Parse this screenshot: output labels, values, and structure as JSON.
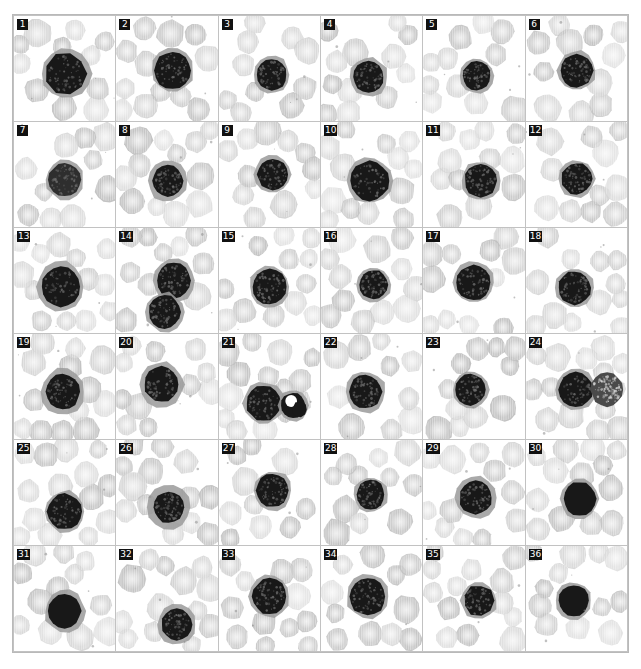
{
  "figure": {
    "name": "blood-cell-montage",
    "grid": {
      "columns": 6,
      "rows": 36
    },
    "colors": {
      "page_background": "#ffffff",
      "panel_background": "#ffffff",
      "grid_line": "#c2c2c2",
      "outer_border": "#b9b9b9",
      "badge_background": "#111111",
      "badge_text": "#ffffff",
      "rbc_fill": "#bdbdbd",
      "rbc_fill_light": "#d4d4d4",
      "nucleus_dark": "#181818",
      "nucleus_mid": "#2e2e2e",
      "cytoplasm": "#9a9a9a"
    }
  },
  "panels": [
    {
      "label": "1",
      "seed": 11,
      "rbc": 11,
      "nucleus": {
        "cx": 52,
        "cy": 55,
        "r": 20,
        "tone": "dark",
        "texture": "speckle",
        "cytoplasm": 4,
        "angular": true
      }
    },
    {
      "label": "2",
      "seed": 23,
      "rbc": 12,
      "nucleus": {
        "cx": 56,
        "cy": 52,
        "r": 18,
        "tone": "dark",
        "texture": "speckle",
        "cytoplasm": 3
      }
    },
    {
      "label": "3",
      "seed": 37,
      "rbc": 10,
      "nucleus": {
        "cx": 52,
        "cy": 56,
        "r": 15,
        "tone": "dark",
        "texture": "speckle",
        "cytoplasm": 3
      }
    },
    {
      "label": "4",
      "seed": 41,
      "rbc": 12,
      "nucleus": {
        "cx": 47,
        "cy": 58,
        "r": 15,
        "tone": "dark",
        "texture": "speckle",
        "cytoplasm": 4
      }
    },
    {
      "label": "5",
      "seed": 53,
      "rbc": 11,
      "nucleus": {
        "cx": 53,
        "cy": 57,
        "r": 14,
        "tone": "dark",
        "texture": "speckle",
        "cytoplasm": 3
      }
    },
    {
      "label": "6",
      "seed": 67,
      "rbc": 11,
      "nucleus": {
        "cx": 50,
        "cy": 52,
        "r": 16,
        "tone": "dark",
        "texture": "speckle",
        "cytoplasm": 3
      }
    },
    {
      "label": "7",
      "seed": 71,
      "rbc": 10,
      "nucleus": {
        "cx": 50,
        "cy": 55,
        "r": 16,
        "tone": "mid",
        "texture": "speckle",
        "cytoplasm": 3
      }
    },
    {
      "label": "8",
      "seed": 83,
      "rbc": 12,
      "nucleus": {
        "cx": 51,
        "cy": 56,
        "r": 15,
        "tone": "dark",
        "texture": "speckle",
        "cytoplasm": 5
      }
    },
    {
      "label": "9",
      "seed": 97,
      "rbc": 11,
      "nucleus": {
        "cx": 53,
        "cy": 50,
        "r": 15,
        "tone": "dark",
        "texture": "speckle",
        "cytoplasm": 3
      }
    },
    {
      "label": "10",
      "seed": 103,
      "rbc": 13,
      "nucleus": {
        "cx": 48,
        "cy": 56,
        "r": 19,
        "tone": "dark",
        "texture": "speckle",
        "cytoplasm": 3
      }
    },
    {
      "label": "11",
      "seed": 109,
      "rbc": 12,
      "nucleus": {
        "cx": 57,
        "cy": 56,
        "r": 16,
        "tone": "dark",
        "texture": "speckle",
        "cytoplasm": 3
      }
    },
    {
      "label": "12",
      "seed": 113,
      "rbc": 11,
      "nucleus": {
        "cx": 50,
        "cy": 54,
        "r": 15,
        "tone": "dark",
        "texture": "speckle",
        "cytoplasm": 3
      }
    },
    {
      "label": "13",
      "seed": 127,
      "rbc": 13,
      "nucleus": {
        "cx": 46,
        "cy": 56,
        "r": 19,
        "tone": "dark",
        "texture": "speckle",
        "cytoplasm": 5
      }
    },
    {
      "label": "14",
      "seed": 131,
      "rbc": 11,
      "nucleus": {
        "cx": 57,
        "cy": 50,
        "r": 17,
        "tone": "dark",
        "texture": "speckle",
        "cytoplasm": 4
      },
      "nucleus2": {
        "cx": 48,
        "cy": 80,
        "r": 16,
        "tone": "dark",
        "texture": "speckle",
        "cytoplasm": 3
      }
    },
    {
      "label": "15",
      "seed": 139,
      "rbc": 12,
      "nucleus": {
        "cx": 50,
        "cy": 56,
        "r": 17,
        "tone": "dark",
        "texture": "speckle",
        "cytoplasm": 3
      }
    },
    {
      "label": "16",
      "seed": 149,
      "rbc": 12,
      "nucleus": {
        "cx": 52,
        "cy": 54,
        "r": 14,
        "tone": "dark",
        "texture": "speckle",
        "cytoplasm": 3
      }
    },
    {
      "label": "17",
      "seed": 151,
      "rbc": 11,
      "nucleus": {
        "cx": 50,
        "cy": 52,
        "r": 17,
        "tone": "dark",
        "texture": "speckle",
        "cytoplasm": 3
      }
    },
    {
      "label": "18",
      "seed": 157,
      "rbc": 12,
      "nucleus": {
        "cx": 48,
        "cy": 57,
        "r": 16,
        "tone": "dark",
        "texture": "speckle",
        "cytoplasm": 3
      }
    },
    {
      "label": "19",
      "seed": 163,
      "rbc": 13,
      "nucleus": {
        "cx": 48,
        "cy": 55,
        "r": 17,
        "tone": "dark",
        "texture": "speckle",
        "cytoplasm": 5
      }
    },
    {
      "label": "20",
      "seed": 173,
      "rbc": 11,
      "nucleus": {
        "cx": 45,
        "cy": 48,
        "r": 17,
        "tone": "dark",
        "texture": "speckle",
        "cytoplasm": 5
      }
    },
    {
      "label": "21",
      "seed": 179,
      "rbc": 14,
      "nucleus": {
        "cx": 44,
        "cy": 66,
        "r": 17,
        "tone": "dark",
        "texture": "speckle",
        "cytoplasm": 3
      },
      "nucleus2": {
        "cx": 73,
        "cy": 68,
        "r": 12,
        "tone": "dark",
        "texture": "lobed",
        "cytoplasm": 3
      }
    },
    {
      "label": "22",
      "seed": 191,
      "rbc": 10,
      "nucleus": {
        "cx": 44,
        "cy": 55,
        "r": 16,
        "tone": "dark",
        "texture": "speckle",
        "cytoplasm": 4
      }
    },
    {
      "label": "23",
      "seed": 193,
      "rbc": 11,
      "nucleus": {
        "cx": 47,
        "cy": 53,
        "r": 15,
        "tone": "dark",
        "texture": "speckle",
        "cytoplasm": 3
      }
    },
    {
      "label": "24",
      "seed": 197,
      "rbc": 14,
      "nucleus": {
        "cx": 49,
        "cy": 53,
        "r": 17,
        "tone": "dark",
        "texture": "speckle",
        "cytoplasm": 3
      },
      "nucleus2": {
        "cx": 80,
        "cy": 53,
        "r": 16,
        "tone": "granular",
        "texture": "granular",
        "cytoplasm": 0
      }
    },
    {
      "label": "25",
      "seed": 199,
      "rbc": 14,
      "nucleus": {
        "cx": 50,
        "cy": 68,
        "r": 17,
        "tone": "dark",
        "texture": "speckle",
        "cytoplasm": 3
      }
    },
    {
      "label": "26",
      "seed": 211,
      "rbc": 13,
      "nucleus": {
        "cx": 52,
        "cy": 64,
        "r": 15,
        "tone": "dark",
        "texture": "speckle",
        "cytoplasm": 6
      }
    },
    {
      "label": "27",
      "seed": 223,
      "rbc": 10,
      "nucleus": {
        "cx": 53,
        "cy": 48,
        "r": 16,
        "tone": "dark",
        "texture": "speckle",
        "cytoplasm": 3
      }
    },
    {
      "label": "28",
      "seed": 227,
      "rbc": 11,
      "nucleus": {
        "cx": 49,
        "cy": 52,
        "r": 14,
        "tone": "dark",
        "texture": "speckle",
        "cytoplasm": 3
      }
    },
    {
      "label": "29",
      "seed": 229,
      "rbc": 12,
      "nucleus": {
        "cx": 52,
        "cy": 55,
        "r": 16,
        "tone": "dark",
        "texture": "speckle",
        "cytoplasm": 4
      }
    },
    {
      "label": "30",
      "seed": 233,
      "rbc": 13,
      "nucleus": {
        "cx": 53,
        "cy": 56,
        "r": 16,
        "tone": "dark",
        "texture": "solid",
        "cytoplasm": 3
      }
    },
    {
      "label": "31",
      "seed": 239,
      "rbc": 12,
      "nucleus": {
        "cx": 50,
        "cy": 62,
        "r": 16,
        "tone": "dark",
        "texture": "solid",
        "cytoplasm": 4
      }
    },
    {
      "label": "32",
      "seed": 241,
      "rbc": 13,
      "nucleus": {
        "cx": 60,
        "cy": 75,
        "r": 15,
        "tone": "dark",
        "texture": "speckle",
        "cytoplasm": 4
      }
    },
    {
      "label": "33",
      "seed": 251,
      "rbc": 12,
      "nucleus": {
        "cx": 50,
        "cy": 48,
        "r": 17,
        "tone": "dark",
        "texture": "speckle",
        "cytoplasm": 3
      }
    },
    {
      "label": "34",
      "seed": 257,
      "rbc": 11,
      "nucleus": {
        "cx": 46,
        "cy": 48,
        "r": 18,
        "tone": "dark",
        "texture": "speckle",
        "cytoplasm": 3
      }
    },
    {
      "label": "35",
      "seed": 263,
      "rbc": 13,
      "nucleus": {
        "cx": 55,
        "cy": 52,
        "r": 15,
        "tone": "dark",
        "texture": "speckle",
        "cytoplasm": 3,
        "angular": true
      }
    },
    {
      "label": "36",
      "seed": 269,
      "rbc": 12,
      "nucleus": {
        "cx": 47,
        "cy": 52,
        "r": 15,
        "tone": "dark",
        "texture": "solid",
        "cytoplasm": 3
      }
    }
  ]
}
